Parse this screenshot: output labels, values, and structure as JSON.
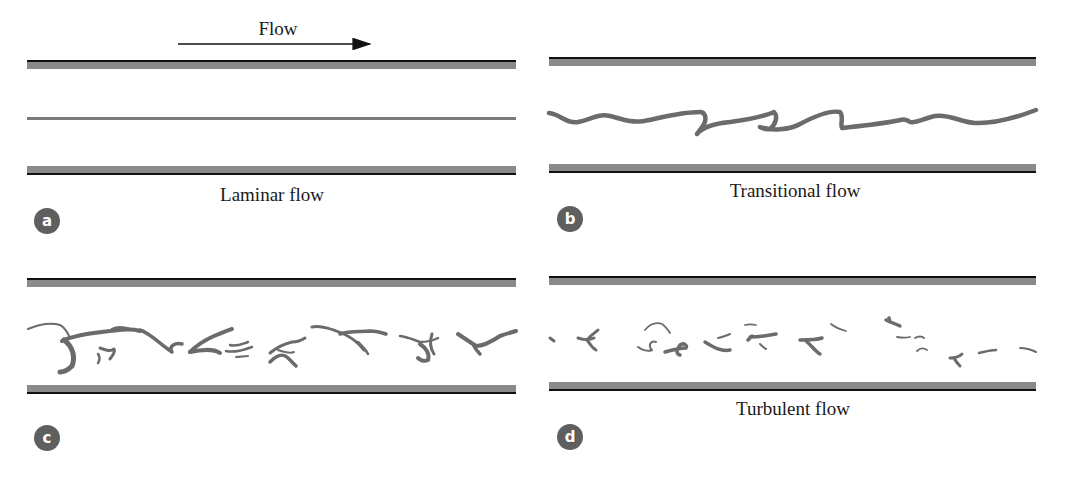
{
  "header": {
    "flow_label": "Flow",
    "arrow": {
      "x1": 178,
      "x2": 370,
      "y": 44,
      "direction": "right"
    }
  },
  "colors": {
    "wall_gray": "#8a8a8a",
    "wall_edge": "#111111",
    "stream": "#6b6b6b",
    "badge_bg": "#5f5f5f",
    "badge_fg": "#ffffff",
    "text": "#1a1a1a"
  },
  "panels": [
    {
      "id": "a",
      "badge": "a",
      "caption": "Laminar flow",
      "regime": "laminar",
      "pipe": {
        "x1": 27,
        "x2": 516,
        "top_y": 60,
        "bottom_y": 175
      }
    },
    {
      "id": "b",
      "badge": "b",
      "caption": "Transitional flow",
      "regime": "transitional",
      "pipe": {
        "x1": 549,
        "x2": 1036,
        "top_y": 57,
        "bottom_y": 173
      }
    },
    {
      "id": "c",
      "badge": "c",
      "caption": "",
      "regime": "turbulent",
      "pipe": {
        "x1": 27,
        "x2": 516,
        "top_y": 278,
        "bottom_y": 394
      }
    },
    {
      "id": "d",
      "badge": "d",
      "caption": "Turbulent flow",
      "regime": "turbulent",
      "pipe": {
        "x1": 549,
        "x2": 1036,
        "top_y": 276,
        "bottom_y": 391
      }
    }
  ]
}
